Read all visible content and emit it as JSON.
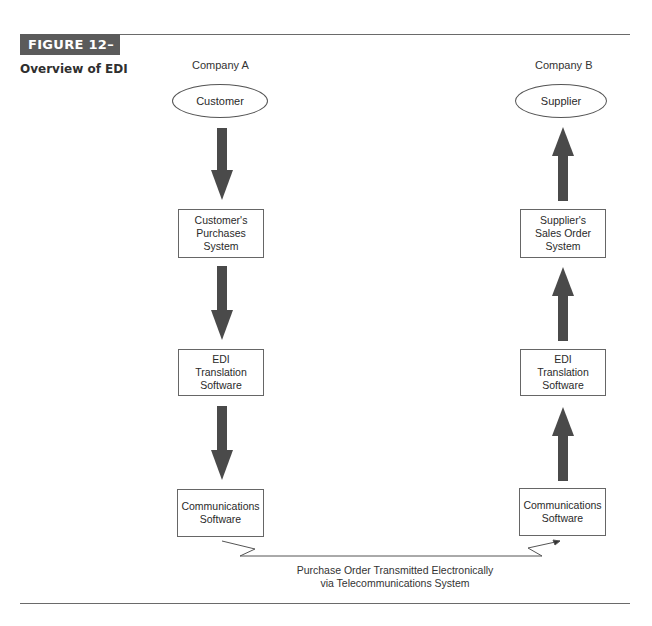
{
  "figure": {
    "badge": "FIGURE 12–18",
    "title": "Overview of EDI",
    "colors": {
      "badge_bg": "#5b5b5b",
      "arrow": "#4a4a4a",
      "rule": "#6a6a6a"
    }
  },
  "companies": {
    "left": {
      "label": "Company A",
      "entity": "Customer"
    },
    "right": {
      "label": "Company B",
      "entity": "Supplier"
    }
  },
  "left_column": {
    "boxes": [
      {
        "label": "Customer's\nPurchases\nSystem"
      },
      {
        "label": "EDI\nTranslation\nSoftware"
      },
      {
        "label": "Communications\nSoftware"
      }
    ],
    "arrow_direction": "down"
  },
  "right_column": {
    "boxes": [
      {
        "label": "Supplier's\nSales Order\nSystem"
      },
      {
        "label": "EDI\nTranslation\nSoftware"
      },
      {
        "label": "Communications\nSoftware"
      }
    ],
    "arrow_direction": "up"
  },
  "link": {
    "caption_line1": "Purchase Order Transmitted Electronically",
    "caption_line2": "via Telecommunications System"
  }
}
